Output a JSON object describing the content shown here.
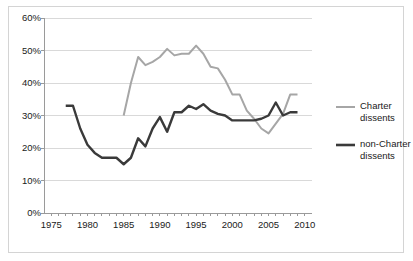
{
  "chart_data": {
    "type": "line",
    "title": "",
    "xlabel": "",
    "ylabel": "",
    "xlim": [
      1974,
      2011
    ],
    "ylim": [
      0,
      0.6
    ],
    "grid": true,
    "legend_position": "right",
    "x_ticks": [
      "1975",
      "1980",
      "1985",
      "1990",
      "1995",
      "2000",
      "2005",
      "2010"
    ],
    "x_tick_values": [
      1975,
      1980,
      1985,
      1990,
      1995,
      2000,
      2005,
      2010
    ],
    "y_ticks": [
      "0%",
      "10%",
      "20%",
      "30%",
      "40%",
      "50%",
      "60%"
    ],
    "y_tick_values": [
      0,
      10,
      20,
      30,
      40,
      50,
      60
    ],
    "series": [
      {
        "name": "Charter dissents",
        "color": "#a6a6a6",
        "width": 2.0,
        "x": [
          1985,
          1986,
          1987,
          1988,
          1989,
          1990,
          1991,
          1992,
          1993,
          1994,
          1995,
          1996,
          1997,
          1998,
          1999,
          2000,
          2001,
          2002,
          2003,
          2004,
          2005,
          2006,
          2007,
          2008,
          2009
        ],
        "values": [
          30.0,
          40.0,
          48.0,
          45.5,
          46.5,
          48.0,
          50.5,
          48.5,
          49.0,
          49.0,
          51.5,
          49.0,
          45.0,
          44.5,
          41.0,
          36.5,
          36.5,
          31.5,
          29.0,
          26.0,
          24.5,
          27.5,
          30.5,
          36.5,
          36.5
        ]
      },
      {
        "name": "non-Charter dissents",
        "color": "#3a3a3a",
        "width": 2.4,
        "x": [
          1977,
          1978,
          1979,
          1980,
          1981,
          1982,
          1983,
          1984,
          1985,
          1986,
          1987,
          1988,
          1989,
          1990,
          1991,
          1992,
          1993,
          1994,
          1995,
          1996,
          1997,
          1998,
          1999,
          2000,
          2001,
          2002,
          2003,
          2004,
          2005,
          2006,
          2007,
          2008,
          2009
        ],
        "values": [
          33.0,
          33.0,
          26.0,
          21.0,
          18.5,
          17.0,
          17.0,
          17.0,
          15.0,
          17.0,
          23.0,
          20.5,
          26.0,
          29.5,
          25.0,
          31.0,
          31.0,
          33.0,
          32.0,
          33.5,
          31.5,
          30.5,
          30.0,
          28.5,
          28.5,
          28.5,
          28.5,
          29.0,
          30.0,
          34.0,
          30.0,
          31.0,
          31.0
        ]
      }
    ]
  },
  "legend": {
    "items": [
      {
        "label_line1": "Charter",
        "label_line2": "dissents",
        "color": "#a6a6a6"
      },
      {
        "label_line1": "non-Charter",
        "label_line2": "dissents",
        "color": "#3a3a3a"
      }
    ]
  }
}
